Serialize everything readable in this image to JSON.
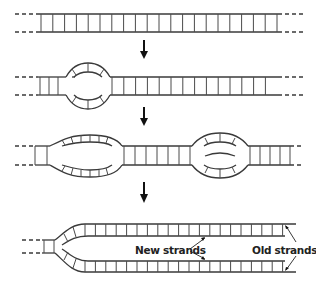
{
  "figure": {
    "panels": [
      {
        "step": 1,
        "description": "Unreplicated double-stranded DNA"
      },
      {
        "step": 2,
        "description": "Single replication bubble forms"
      },
      {
        "step": 3,
        "description": "Two replication bubbles expand"
      },
      {
        "step": 4,
        "description": "Replication fork with new and old strands"
      }
    ],
    "labels": {
      "new_strands": "New strands",
      "old_strands": "Old strands"
    },
    "colors": {
      "line": "#3a3a3a",
      "arrow": "#111111",
      "background": "#ffffff"
    }
  }
}
